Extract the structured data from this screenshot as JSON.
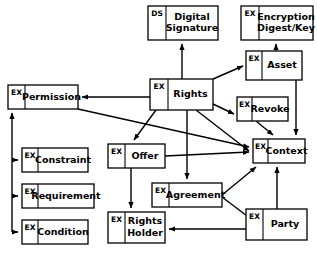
{
  "diagram": {
    "type": "entity-relationship-diagram",
    "colors": {
      "background": "#ffffff",
      "stroke": "#000000",
      "node_fill": "#ffffff"
    },
    "nodes": [
      {
        "id": "digital-signature",
        "stereotype": "DS",
        "label_lines": [
          "Digital",
          "Signature"
        ],
        "x": 148,
        "y": 6,
        "w": 70,
        "h": 34,
        "split": 18
      },
      {
        "id": "encryption-digest-key",
        "stereotype": "EX",
        "label_lines": [
          "Encryption",
          "Digest/Key"
        ],
        "x": 241,
        "y": 6,
        "w": 72,
        "h": 34,
        "split": 18
      },
      {
        "id": "asset",
        "stereotype": "EX",
        "label_lines": [
          "Asset"
        ],
        "x": 246,
        "y": 51,
        "w": 56,
        "h": 29,
        "split": 16
      },
      {
        "id": "rights",
        "stereotype": "EX",
        "label_lines": [
          "Rights"
        ],
        "x": 150,
        "y": 79,
        "w": 63,
        "h": 31,
        "split": 18
      },
      {
        "id": "permission",
        "stereotype": "EX",
        "label_lines": [
          "Permission"
        ],
        "x": 8,
        "y": 85,
        "w": 70,
        "h": 24,
        "split": 17
      },
      {
        "id": "revoke",
        "stereotype": "EX",
        "label_lines": [
          "Revoke"
        ],
        "x": 237,
        "y": 97,
        "w": 51,
        "h": 24,
        "split": 15
      },
      {
        "id": "context",
        "stereotype": "EX",
        "label_lines": [
          "Context"
        ],
        "x": 253,
        "y": 139,
        "w": 52,
        "h": 24,
        "split": 15
      },
      {
        "id": "constraint",
        "stereotype": "EX",
        "label_lines": [
          "Constraint"
        ],
        "x": 22,
        "y": 148,
        "w": 66,
        "h": 24,
        "split": 16
      },
      {
        "id": "offer",
        "stereotype": "EX",
        "label_lines": [
          "Offer"
        ],
        "x": 108,
        "y": 144,
        "w": 57,
        "h": 24,
        "split": 17
      },
      {
        "id": "requirement",
        "stereotype": "EX",
        "label_lines": [
          "Requirement"
        ],
        "x": 22,
        "y": 184,
        "w": 72,
        "h": 24,
        "split": 16
      },
      {
        "id": "agreement",
        "stereotype": "EX",
        "label_lines": [
          "Agreement"
        ],
        "x": 152,
        "y": 183,
        "w": 70,
        "h": 24,
        "split": 17
      },
      {
        "id": "condition",
        "stereotype": "EX",
        "label_lines": [
          "Condition"
        ],
        "x": 22,
        "y": 220,
        "w": 66,
        "h": 24,
        "split": 16
      },
      {
        "id": "rights-holder",
        "stereotype": "EX",
        "label_lines": [
          "Rights",
          "Holder"
        ],
        "x": 108,
        "y": 212,
        "w": 57,
        "h": 31,
        "split": 17
      },
      {
        "id": "party",
        "stereotype": "EX",
        "label_lines": [
          "Party"
        ],
        "x": 246,
        "y": 209,
        "w": 61,
        "h": 31,
        "split": 17
      }
    ],
    "edges": [
      {
        "id": "rights-to-digital-signature",
        "from": "rights",
        "to": "digital-signature",
        "points": "182,79 182,44",
        "arrow": true
      },
      {
        "id": "asset-to-encryption",
        "from": "asset",
        "to": "encryption-digest-key",
        "points": "276,51 276,44",
        "arrow": true
      },
      {
        "id": "rights-to-asset",
        "from": "rights",
        "to": "asset",
        "points": "213,79 243,66",
        "arrow": true
      },
      {
        "id": "rights-to-permission",
        "from": "rights",
        "to": "permission",
        "points": "150,97 82,97",
        "arrow": true
      },
      {
        "id": "rights-to-revoke",
        "from": "rights",
        "to": "revoke",
        "points": "213,104 234,114",
        "arrow": true
      },
      {
        "id": "asset-to-context",
        "from": "asset",
        "to": "context",
        "points": "296,80 296,135",
        "arrow": true
      },
      {
        "id": "revoke-to-context",
        "from": "revoke",
        "to": "context",
        "points": "256,121 273,135",
        "arrow": true
      },
      {
        "id": "permission-to-context",
        "from": "permission",
        "to": "context",
        "points": "78,109 249,147",
        "arrow": true
      },
      {
        "id": "permission-to-sub-spine",
        "from": "permission",
        "to": "constraint",
        "points": "12,232 12,113",
        "arrow": true
      },
      {
        "id": "spine-to-constraint",
        "from": "permission",
        "to": "constraint",
        "points": "12,160 18,160",
        "arrow": true
      },
      {
        "id": "spine-to-requirement",
        "from": "permission",
        "to": "requirement",
        "points": "12,196 18,196",
        "arrow": true
      },
      {
        "id": "spine-to-condition",
        "from": "permission",
        "to": "condition",
        "points": "12,232 18,232",
        "arrow": true
      },
      {
        "id": "rights-to-offer",
        "from": "rights",
        "to": "offer",
        "points": "156,110 134,140",
        "arrow": true
      },
      {
        "id": "rights-to-agreement",
        "from": "rights",
        "to": "agreement",
        "points": "187,110 187,179",
        "arrow": true
      },
      {
        "id": "rights-to-context",
        "from": "rights",
        "to": "context",
        "points": "196,110 249,151",
        "arrow": true
      },
      {
        "id": "offer-to-context",
        "from": "offer",
        "to": "context",
        "points": "165,156 249,152",
        "arrow": true
      },
      {
        "id": "offer-to-rights-holder",
        "from": "offer",
        "to": "rights-holder",
        "points": "131,168 131,208",
        "arrow": true
      },
      {
        "id": "agreement-to-context",
        "from": "agreement",
        "to": "context",
        "points": "222,195 256,167",
        "arrow": true
      },
      {
        "id": "agreement-to-party",
        "from": "agreement",
        "to": "party",
        "points": "222,197 255,222",
        "arrow": true
      },
      {
        "id": "party-to-context",
        "from": "party",
        "to": "context",
        "points": "277,209 277,167",
        "arrow": true
      },
      {
        "id": "party-to-rights-holder",
        "from": "party",
        "to": "rights-holder",
        "points": "246,229 169,229",
        "arrow": true
      }
    ]
  }
}
